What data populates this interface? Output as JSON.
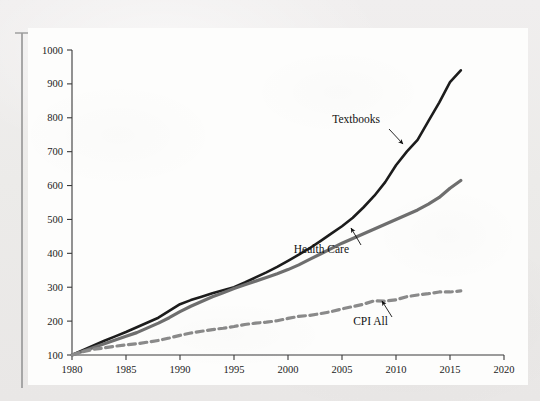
{
  "figure": {
    "background_color": "#fdfdfc",
    "page_color": "#eceaea",
    "axis_color": "#3a3a3a"
  },
  "chart_data": {
    "type": "line",
    "title": "",
    "subtitle": "",
    "xlabel": "",
    "ylabel": "",
    "xlim": [
      1980,
      2020
    ],
    "ylim": [
      100,
      1000
    ],
    "xticks": [
      "1980",
      "1985",
      "1990",
      "1995",
      "2000",
      "2005",
      "2010",
      "2015",
      "2020"
    ],
    "yticks": [
      "100",
      "200",
      "300",
      "400",
      "500",
      "600",
      "700",
      "800",
      "900",
      "1000"
    ],
    "grid": false,
    "legend_position": "inline-annotations",
    "index_base": "1980 = 100",
    "x": [
      1980,
      1981,
      1982,
      1983,
      1984,
      1985,
      1986,
      1987,
      1988,
      1989,
      1990,
      1991,
      1992,
      1993,
      1994,
      1995,
      1996,
      1997,
      1998,
      1999,
      2000,
      2001,
      2002,
      2003,
      2004,
      2005,
      2006,
      2007,
      2008,
      2009,
      2010,
      2011,
      2012,
      2013,
      2014,
      2015,
      2016
    ],
    "series": [
      {
        "name": "Textbooks",
        "color": "#1c1c1c",
        "style": "solid",
        "width": 2.6,
        "annotation": "Textbooks",
        "values": [
          100,
          114,
          128,
          142,
          155,
          168,
          182,
          196,
          210,
          230,
          250,
          262,
          272,
          282,
          291,
          300,
          314,
          329,
          344,
          360,
          378,
          396,
          415,
          436,
          458,
          480,
          505,
          536,
          570,
          610,
          660,
          700,
          735,
          790,
          845,
          905,
          940
        ]
      },
      {
        "name": "Health Care",
        "color": "#6e6e6e",
        "style": "solid",
        "width": 3.2,
        "annotation": "Health Care",
        "values": [
          100,
          111,
          122,
          133,
          144,
          155,
          166,
          180,
          194,
          210,
          228,
          244,
          258,
          272,
          284,
          296,
          307,
          318,
          329,
          340,
          352,
          366,
          382,
          398,
          414,
          430,
          444,
          458,
          472,
          486,
          500,
          514,
          528,
          545,
          565,
          592,
          615
        ]
      },
      {
        "name": "CPI All",
        "color": "#8a8a8a",
        "style": "dashed",
        "width": 3.2,
        "annotation": "CPI All",
        "values": [
          100,
          110,
          117,
          121,
          126,
          130,
          133,
          138,
          143,
          150,
          158,
          165,
          170,
          175,
          179,
          184,
          190,
          194,
          197,
          201,
          208,
          214,
          217,
          222,
          228,
          236,
          243,
          250,
          260,
          259,
          263,
          272,
          277,
          281,
          286,
          286,
          289
        ]
      }
    ],
    "annotations": [
      {
        "label": "Textbooks",
        "text_x": 380,
        "text_y": 123,
        "arrow_from_x": 389,
        "arrow_from_y": 129,
        "arrow_to_x": 403,
        "arrow_to_y": 144
      },
      {
        "label": "Health Care",
        "text_x": 349,
        "text_y": 253,
        "arrow_from_x": 361,
        "arrow_from_y": 245,
        "arrow_to_x": 351,
        "arrow_to_y": 228
      },
      {
        "label": "CPI All",
        "text_x": 388,
        "text_y": 325,
        "arrow_from_x": 392,
        "arrow_from_y": 317,
        "arrow_to_x": 382,
        "arrow_to_y": 301
      }
    ]
  }
}
